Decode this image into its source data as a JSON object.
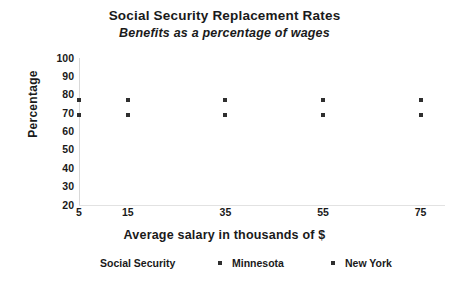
{
  "chart_data": {
    "type": "scatter",
    "title": "Social Security Replacement Rates",
    "subtitle": "Benefits as a percentage of wages",
    "xlabel": "Average salary in thousands of $",
    "ylabel": "Percentage",
    "grid": false,
    "legend_position": "bottom",
    "xlim": [
      5,
      80
    ],
    "ylim": [
      20,
      100
    ],
    "xticks": [
      "5",
      "15",
      "35",
      "55",
      "75"
    ],
    "xtick_values": [
      5,
      15,
      35,
      55,
      75
    ],
    "yticks": [
      "100",
      "90",
      "80",
      "70",
      "60",
      "50",
      "40",
      "30",
      "20"
    ],
    "ytick_values": [
      100,
      90,
      80,
      70,
      60,
      50,
      40,
      30,
      20
    ],
    "x": [
      5,
      15,
      35,
      55,
      75
    ],
    "series": [
      {
        "name": "Minnesota",
        "marker": "square",
        "color": "#2f2f2f",
        "values": [
          77,
          77,
          77,
          77,
          77
        ]
      },
      {
        "name": "New York",
        "marker": "square",
        "color": "#2f2f2f",
        "values": [
          69,
          69,
          69,
          69,
          69
        ]
      }
    ],
    "legend_entries": [
      {
        "label": "Social Security",
        "has_marker": false
      },
      {
        "label": "Minnesota",
        "has_marker": true
      },
      {
        "label": "New York",
        "has_marker": true
      }
    ]
  }
}
